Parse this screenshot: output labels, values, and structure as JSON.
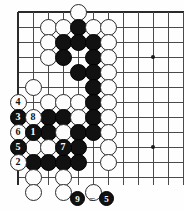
{
  "diagram": {
    "kind": "go-board-problem-diagram",
    "board": {
      "columns": 11,
      "rows": 12,
      "origin_x": 18,
      "origin_y": 12,
      "spacing": 15,
      "edges": [
        "left",
        "top"
      ],
      "star_points": [
        {
          "col": 9,
          "row": 3
        },
        {
          "col": 9,
          "row": 9
        }
      ]
    },
    "stones": [
      {
        "col": 4,
        "row": 0,
        "color": "white"
      },
      {
        "col": 2,
        "row": 1,
        "color": "white"
      },
      {
        "col": 3,
        "row": 1,
        "color": "white"
      },
      {
        "col": 4,
        "row": 1,
        "color": "black"
      },
      {
        "col": 5,
        "row": 1,
        "color": "white"
      },
      {
        "col": 6,
        "row": 1,
        "color": "white"
      },
      {
        "col": 2,
        "row": 2,
        "color": "white"
      },
      {
        "col": 3,
        "row": 2,
        "color": "black"
      },
      {
        "col": 4,
        "row": 2,
        "color": "black"
      },
      {
        "col": 5,
        "row": 2,
        "color": "black"
      },
      {
        "col": 6,
        "row": 2,
        "color": "white"
      },
      {
        "col": 2,
        "row": 3,
        "color": "white"
      },
      {
        "col": 3,
        "row": 3,
        "color": "black"
      },
      {
        "col": 5,
        "row": 3,
        "color": "black"
      },
      {
        "col": 6,
        "row": 3,
        "color": "white"
      },
      {
        "col": 4,
        "row": 4,
        "color": "black"
      },
      {
        "col": 5,
        "row": 4,
        "color": "black"
      },
      {
        "col": 6,
        "row": 4,
        "color": "white"
      },
      {
        "col": 1,
        "row": 5,
        "color": "white"
      },
      {
        "col": 5,
        "row": 5,
        "color": "black"
      },
      {
        "col": 6,
        "row": 5,
        "color": "white"
      },
      {
        "col": 0,
        "row": 6,
        "color": "white",
        "label": "4"
      },
      {
        "col": 2,
        "row": 6,
        "color": "white"
      },
      {
        "col": 3,
        "row": 6,
        "color": "white"
      },
      {
        "col": 4,
        "row": 6,
        "color": "white"
      },
      {
        "col": 5,
        "row": 6,
        "color": "black"
      },
      {
        "col": 6,
        "row": 6,
        "color": "white"
      },
      {
        "col": 0,
        "row": 7,
        "color": "black",
        "label": "3"
      },
      {
        "col": 1,
        "row": 7,
        "color": "white",
        "label": "8"
      },
      {
        "col": 2,
        "row": 7,
        "color": "black"
      },
      {
        "col": 3,
        "row": 7,
        "color": "black"
      },
      {
        "col": 4,
        "row": 7,
        "color": "white"
      },
      {
        "col": 5,
        "row": 7,
        "color": "black"
      },
      {
        "col": 6,
        "row": 7,
        "color": "white"
      },
      {
        "col": 0,
        "row": 8,
        "color": "white",
        "label": "6"
      },
      {
        "col": 1,
        "row": 8,
        "color": "black",
        "label": "1"
      },
      {
        "col": 2,
        "row": 8,
        "color": "black"
      },
      {
        "col": 3,
        "row": 8,
        "color": "white"
      },
      {
        "col": 4,
        "row": 8,
        "color": "black"
      },
      {
        "col": 5,
        "row": 8,
        "color": "black"
      },
      {
        "col": 6,
        "row": 8,
        "color": "white"
      },
      {
        "col": 0,
        "row": 9,
        "color": "black",
        "label": "5"
      },
      {
        "col": 1,
        "row": 9,
        "color": "white"
      },
      {
        "col": 2,
        "row": 9,
        "color": "white"
      },
      {
        "col": 3,
        "row": 9,
        "color": "black",
        "label": "7"
      },
      {
        "col": 4,
        "row": 9,
        "color": "black"
      },
      {
        "col": 6,
        "row": 9,
        "color": "white"
      },
      {
        "col": 0,
        "row": 10,
        "color": "white",
        "label": "2"
      },
      {
        "col": 1,
        "row": 10,
        "color": "black"
      },
      {
        "col": 2,
        "row": 10,
        "color": "black"
      },
      {
        "col": 3,
        "row": 10,
        "color": "black"
      },
      {
        "col": 4,
        "row": 10,
        "color": "black"
      },
      {
        "col": 6,
        "row": 10,
        "color": "white"
      },
      {
        "col": 1,
        "row": 11,
        "color": "white"
      },
      {
        "col": 3,
        "row": 11,
        "color": "white"
      },
      {
        "col": 1,
        "row": 12,
        "color": "white"
      },
      {
        "col": 3,
        "row": 12,
        "color": "white"
      },
      {
        "col": 5,
        "row": 12,
        "color": "white"
      }
    ],
    "caption": {
      "left_label": "9",
      "left_color": "black",
      "equals": "=",
      "right_label": "5",
      "right_color": "black",
      "text": "9 = 5"
    },
    "colors": {
      "black_stone": "#111111",
      "white_stone": "#fdfdfd",
      "grid_line": "#4a4a4a",
      "board_edge": "#2a2a2a",
      "background": "#fefefe"
    }
  }
}
